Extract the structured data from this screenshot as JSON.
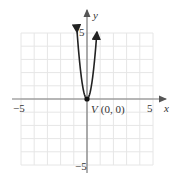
{
  "chart_data": {
    "type": "line",
    "title": "",
    "xlabel": "x",
    "ylabel": "y",
    "xlim": [
      -5,
      5
    ],
    "ylim": [
      -5,
      5
    ],
    "grid": true,
    "x_ticks_labeled": [
      "-5",
      "5"
    ],
    "y_ticks_labeled": [
      "5",
      "-5"
    ],
    "series": [
      {
        "name": "parabola",
        "equation": "y = 9x^2",
        "x": [
          -0.75,
          -0.5,
          -0.25,
          0,
          0.25,
          0.5,
          0.75
        ],
        "y": [
          5.06,
          2.25,
          0.56,
          0,
          0.56,
          2.25,
          5.06
        ]
      }
    ],
    "annotations": [
      {
        "text": "V (0, 0)",
        "x": 0,
        "y": 0,
        "marker": "filled-circle"
      }
    ]
  },
  "labels": {
    "x_axis": "x",
    "y_axis": "y",
    "x_min": "−5",
    "x_max": "5",
    "y_max": "5",
    "y_min": "−5",
    "vertex_letter": "V",
    "vertex_coords": "(0, 0)"
  },
  "colors": {
    "grid": "#e6e6e6",
    "axis": "#7a7a7a",
    "curve": "#222222"
  }
}
